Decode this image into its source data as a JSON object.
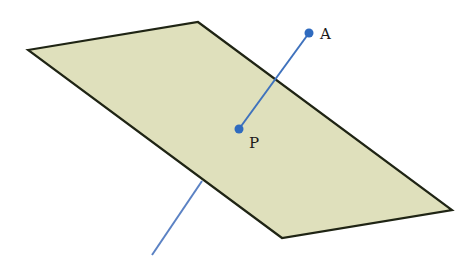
{
  "diagram": {
    "type": "geometry-3d",
    "plane": {
      "vertices": [
        [
          28,
          50
        ],
        [
          198,
          22
        ],
        [
          452,
          210
        ],
        [
          282,
          238
        ]
      ],
      "fill_color": "#dfe0bc",
      "stroke_color": "#1f2414"
    },
    "line": {
      "color": "#4a78bf",
      "segment_above": {
        "from": [
          309,
          33
        ],
        "to": [
          239,
          129
        ]
      },
      "segment_below": {
        "from": [
          202,
          181
        ],
        "to": [
          152,
          255
        ]
      }
    },
    "points": [
      {
        "name": "A",
        "x": 309,
        "y": 33,
        "label": "A",
        "label_x": 320,
        "label_y": 39
      },
      {
        "name": "P",
        "x": 239,
        "y": 129,
        "label": "P",
        "label_x": 249,
        "label_y": 148
      }
    ],
    "point_color": "#2f6bbf"
  }
}
